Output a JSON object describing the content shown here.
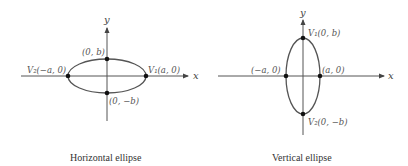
{
  "diagrams": [
    {
      "caption": "Horizontal ellipse",
      "orientation": "horizontal",
      "x_axis_label": "x",
      "y_axis_label": "y",
      "points": [
        {
          "label": "V₂(−a, 0)",
          "coords": "(−a, 0)",
          "name": "V2"
        },
        {
          "label": "V₁(a, 0)",
          "coords": "(a, 0)",
          "name": "V1"
        },
        {
          "label": "(0, b)",
          "coords": "(0, b)",
          "name": "co-vertex-top"
        },
        {
          "label": "(0, −b)",
          "coords": "(0, −b)",
          "name": "co-vertex-bottom"
        }
      ]
    },
    {
      "caption": "Vertical ellipse",
      "orientation": "vertical",
      "x_axis_label": "x",
      "y_axis_label": "y",
      "points": [
        {
          "label": "V₁(0, b)",
          "coords": "(0, b)",
          "name": "V1"
        },
        {
          "label": "V₂(0, −b)",
          "coords": "(0, −b)",
          "name": "V2"
        },
        {
          "label": "(−a, 0)",
          "coords": "(−a, 0)",
          "name": "co-vertex-left"
        },
        {
          "label": "(a, 0)",
          "coords": "(a, 0)",
          "name": "co-vertex-right"
        }
      ]
    }
  ]
}
